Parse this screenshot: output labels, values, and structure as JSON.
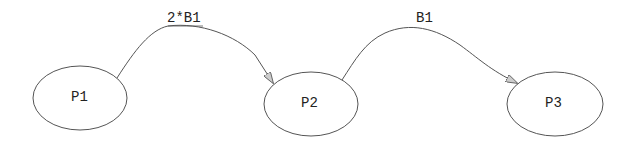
{
  "diagram": {
    "nodes": [
      {
        "id": "P1",
        "label": "P1"
      },
      {
        "id": "P2",
        "label": "P2"
      },
      {
        "id": "P3",
        "label": "P3"
      }
    ],
    "edges": [
      {
        "from": "P1",
        "to": "P2",
        "label": "2*B1"
      },
      {
        "from": "P2",
        "to": "P3",
        "label": "B1"
      }
    ]
  }
}
